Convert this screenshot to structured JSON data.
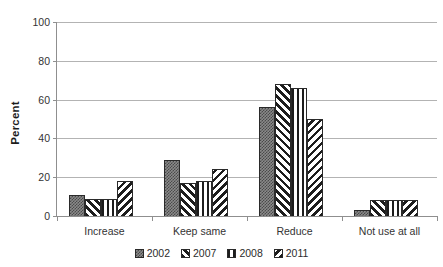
{
  "figure": {
    "title_remnant": "",
    "background_color": "#ffffff"
  },
  "chart_data": {
    "type": "bar",
    "title": "",
    "subtitle": "",
    "xlabel": "",
    "ylabel": "Percent",
    "ylim": [
      0,
      100
    ],
    "yticks": [
      0,
      20,
      40,
      60,
      80,
      100
    ],
    "ytick_labels": [
      "0",
      "20",
      "40",
      "60",
      "80",
      "100"
    ],
    "grid": "horizontal",
    "legend_position": "bottom",
    "categories": [
      "Increase",
      "Keep same",
      "Reduce",
      "Not use at all"
    ],
    "series": [
      {
        "name": "2002",
        "pattern": "dotted-checker",
        "color": "#8a8a8a",
        "values": [
          11,
          29,
          56,
          3
        ]
      },
      {
        "name": "2007",
        "pattern": "forward-diagonal",
        "color": "#1d1d1d",
        "values": [
          9,
          17,
          68,
          8
        ]
      },
      {
        "name": "2008",
        "pattern": "vertical-lines",
        "color": "#1d1d1d",
        "values": [
          9,
          18,
          66,
          8
        ]
      },
      {
        "name": "2011",
        "pattern": "backward-diagonal",
        "color": "#1d1d1d",
        "values": [
          18,
          24,
          50,
          8
        ]
      }
    ]
  },
  "axis": {
    "ytick_labels": [
      "100",
      "80",
      "60",
      "40",
      "20",
      "0"
    ],
    "ylabel": "Percent",
    "xlabels": [
      "Increase",
      "Keep same",
      "Reduce",
      "Not use at all"
    ]
  },
  "legend": {
    "items": [
      {
        "label": "2002"
      },
      {
        "label": "2007"
      },
      {
        "label": "2008"
      },
      {
        "label": "2011"
      }
    ]
  }
}
